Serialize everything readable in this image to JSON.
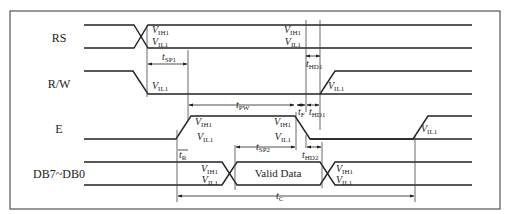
{
  "diagram": {
    "type": "timing-diagram",
    "title": "",
    "signals": [
      {
        "name": "RS"
      },
      {
        "name": "R/W"
      },
      {
        "name": "E"
      },
      {
        "name": "DB7~DB0"
      }
    ],
    "data_label": "Valid Data",
    "voltage_labels": {
      "vih1": {
        "main": "V",
        "sub": "IH1"
      },
      "vil1": {
        "main": "V",
        "sub": "IL1"
      }
    },
    "timing_params": {
      "tsp1": {
        "main": "t",
        "sub": "SP1"
      },
      "tpw": {
        "main": "t",
        "sub": "PW"
      },
      "tf": {
        "main": "t",
        "sub": "F"
      },
      "thd1_top": {
        "main": "t",
        "sub": "HD1"
      },
      "thd1_mid": {
        "main": "t",
        "sub": "HD1"
      },
      "tr": {
        "main": "t",
        "sub": "R"
      },
      "tsp2": {
        "main": "t",
        "sub": "SP2"
      },
      "thd2": {
        "main": "t",
        "sub": "HD2"
      },
      "tc": {
        "main": "t",
        "sub": "C"
      }
    },
    "colors": {
      "line": "#222222",
      "thin": "#444444",
      "border": "#333333"
    }
  }
}
